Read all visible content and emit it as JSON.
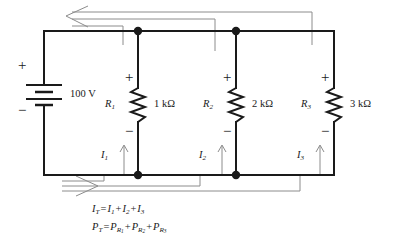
{
  "diagram": {
    "type": "schematic",
    "colors": {
      "wire": "#1a1a1a",
      "current_arrow": "#8c8c8c",
      "text": "#1a1a1a",
      "background": "#ffffff"
    }
  },
  "source": {
    "name": "battery-source",
    "value": "100 V",
    "plus_sign": "+",
    "minus_sign": "−"
  },
  "branches": [
    {
      "id": "branch-1",
      "resistor_label": "R",
      "resistor_sub": "1",
      "value": "1 kΩ",
      "plus_sign": "+",
      "minus_sign": "−",
      "current_label": "I",
      "current_sub": "1"
    },
    {
      "id": "branch-2",
      "resistor_label": "R",
      "resistor_sub": "2",
      "value": "2 kΩ",
      "plus_sign": "+",
      "minus_sign": "−",
      "current_label": "I",
      "current_sub": "2"
    },
    {
      "id": "branch-3",
      "resistor_label": "R",
      "resistor_sub": "3",
      "value": "3 kΩ",
      "plus_sign": "+",
      "minus_sign": "−",
      "current_label": "I",
      "current_sub": "3"
    }
  ],
  "equations": {
    "current": {
      "lhs": "I",
      "lhs_sub": "T",
      "eq": "=",
      "terms": [
        {
          "sym": "I",
          "sub": "1"
        },
        {
          "sym": "I",
          "sub": "2"
        },
        {
          "sym": "I",
          "sub": "3"
        }
      ],
      "plus": "+"
    },
    "power": {
      "lhs": "P",
      "lhs_sub": "T",
      "eq": "=",
      "terms": [
        {
          "sym": "P",
          "sub": "R",
          "subsub": "1"
        },
        {
          "sym": "P",
          "sub": "R",
          "subsub": "2"
        },
        {
          "sym": "P",
          "sub": "R",
          "subsub": "3"
        }
      ],
      "plus": "+"
    }
  }
}
